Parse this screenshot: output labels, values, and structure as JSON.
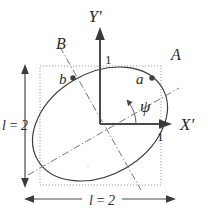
{
  "figure": {
    "type": "geometry-diagram",
    "labels": {
      "axis_x": "X'",
      "axis_y": "Y'",
      "ray_a": "A",
      "ray_b": "B",
      "point_a": "a",
      "point_b": "b",
      "angle": "ψ",
      "unit_y": "1",
      "unit_x": "1",
      "dim_left": "l = 2",
      "dim_bottom": "l = 2"
    },
    "colors": {
      "stroke": "#3a3a3a",
      "axis": "#4a4a4a",
      "dotted_box": "#9a9a9a",
      "dash_dot": "#6e6e6e",
      "marker": "#3f3f3f",
      "background": "#ffffff"
    },
    "geometry": {
      "origin": {
        "x": 100,
        "y": 124
      },
      "box": {
        "x": 40,
        "y": 66,
        "width": 121,
        "height": 119
      },
      "ellipse": {
        "cx": 100,
        "cy": 124,
        "rx": 72,
        "ry": 51,
        "rotation_deg": -30
      },
      "point_a": {
        "x": 152,
        "y": 78
      },
      "point_b": {
        "x": 73,
        "y": 78
      },
      "psi_deg": 30
    }
  }
}
